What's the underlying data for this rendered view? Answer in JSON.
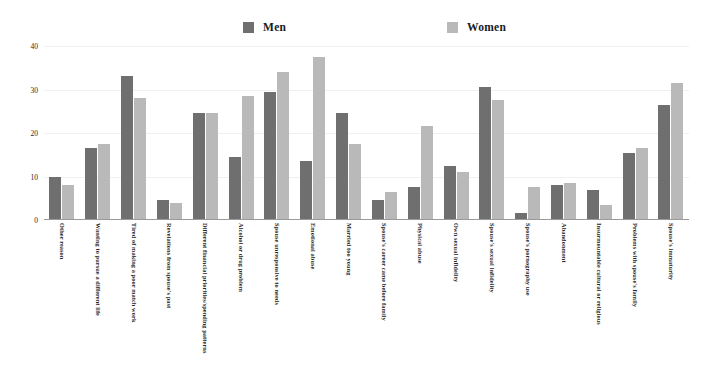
{
  "chart_data": {
    "type": "bar",
    "title": "",
    "subtitle": "",
    "xlabel": "",
    "ylabel": "",
    "ylim": [
      0,
      40
    ],
    "yticks": [
      0,
      10,
      20,
      30,
      40
    ],
    "grid": true,
    "legend_position": "top",
    "orientation": "vertical",
    "grouping": "grouped",
    "xtick_rotation": 90,
    "categories": [
      "Other reason",
      "Wanting to pursue a different life",
      "Tired of making a poor match work",
      "Revelations from spouse's past",
      "Different financial priorities/spending patterns",
      "Alcohol or drug problem",
      "Spouse unresponsive to needs",
      "Emotional abuse",
      "Married too young",
      "Spouse's career came before family",
      "Physical abuse",
      "Own sexual infidelity",
      "Spouse's sexual infidelity",
      "Spouse's pornography use",
      "Abandonment",
      "Insurmountable cultural or religious",
      "Problems with spouse's family",
      "Spouse's immaturity"
    ],
    "series": [
      {
        "name": "Men",
        "color": "#6f6f6f",
        "values": [
          10,
          16.5,
          33,
          4.5,
          24.5,
          14.5,
          29.5,
          13.5,
          24.5,
          4.5,
          7.5,
          12.5,
          30.5,
          1.5,
          8,
          7,
          15.5,
          26.5
        ]
      },
      {
        "name": "Women",
        "color": "#b9b9b9",
        "values": [
          8,
          17.5,
          28,
          4,
          24.5,
          28.5,
          34,
          37.5,
          17.5,
          6.5,
          21.5,
          11,
          27.5,
          7.5,
          8.5,
          3.5,
          16.5,
          31.5
        ]
      }
    ]
  },
  "legend": {
    "entries": [
      {
        "label": "Men",
        "color": "#6f6f6f"
      },
      {
        "label": "Women",
        "color": "#b9b9b9"
      }
    ]
  },
  "axis": {
    "y_ticks": [
      "0",
      "10",
      "20",
      "30",
      "40"
    ]
  }
}
